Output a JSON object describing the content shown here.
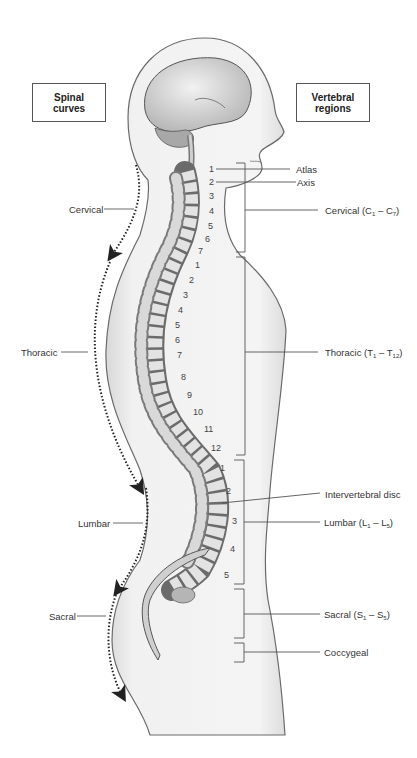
{
  "boxes": {
    "left": "Spinal curves",
    "right": "Vertebral regions"
  },
  "spinal_curves": [
    {
      "label": "Cervical"
    },
    {
      "label": "Thoracic"
    },
    {
      "label": "Lumbar"
    },
    {
      "label": "Sacral"
    }
  ],
  "vertebral_regions": {
    "atlas": "Atlas",
    "axis": "Axis",
    "cervical": {
      "name": "Cervical",
      "open": "(C",
      "s1": "1",
      "dash": " – C",
      "s2": "7",
      "close": ")"
    },
    "thoracic": {
      "name": "Thoracic",
      "open": "(T",
      "s1": "1",
      "dash": " – T",
      "s2": "12",
      "close": ")"
    },
    "intervertebral_disc": "Intervertebral disc",
    "lumbar": {
      "name": "Lumbar",
      "open": "(L",
      "s1": "1",
      "dash": " – L",
      "s2": "5",
      "close": ")"
    },
    "sacral": {
      "name": "Sacral",
      "open": "(S",
      "s1": "1",
      "dash": " – S",
      "s2": "5",
      "close": ")"
    },
    "coccygeal": "Coccygeal"
  },
  "vertebra_numbers": {
    "cervical": [
      "1",
      "2",
      "3",
      "4",
      "5",
      "6",
      "7"
    ],
    "thoracic": [
      "1",
      "2",
      "3",
      "4",
      "5",
      "6",
      "7",
      "8",
      "9",
      "10",
      "11",
      "12"
    ],
    "lumbar": [
      "1",
      "2",
      "3",
      "4",
      "5"
    ]
  }
}
